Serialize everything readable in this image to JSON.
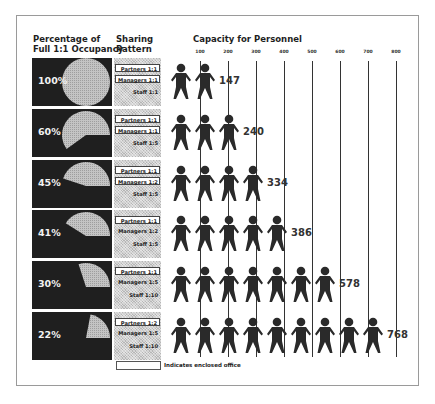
{
  "headers": {
    "occupancy_line1": "Percentage of",
    "occupancy_line2": "Full 1:1 Occupancy",
    "sharing_line1": "Sharing",
    "sharing_line2": "Pattern",
    "capacity": "Capacity for Personnel"
  },
  "axis_ticks": [
    "100",
    "200",
    "300",
    "400",
    "500",
    "600",
    "700",
    "800"
  ],
  "rows": [
    {
      "pct_label": "100%",
      "pct": 100,
      "partners": "Partners 1:1",
      "partners_enclosed": true,
      "managers": "Managers 1:1",
      "managers_enclosed": true,
      "staff": "Staff 1:1",
      "staff_enclosed": false,
      "people": 2,
      "capacity": "147"
    },
    {
      "pct_label": "60%",
      "pct": 60,
      "partners": "Partners 1:1",
      "partners_enclosed": true,
      "managers": "Managers 1:1",
      "managers_enclosed": true,
      "staff": "Staff 1:5",
      "staff_enclosed": false,
      "people": 3,
      "capacity": "240"
    },
    {
      "pct_label": "45%",
      "pct": 45,
      "partners": "Partners 1:1",
      "partners_enclosed": true,
      "managers": "Managers 1:2",
      "managers_enclosed": true,
      "staff": "Staff 1:5",
      "staff_enclosed": false,
      "people": 4,
      "capacity": "334"
    },
    {
      "pct_label": "41%",
      "pct": 41,
      "partners": "Partners 1:1",
      "partners_enclosed": true,
      "managers": "Managers 1:2",
      "managers_enclosed": false,
      "staff": "Staff 1:5",
      "staff_enclosed": false,
      "people": 5,
      "capacity": "386"
    },
    {
      "pct_label": "30%",
      "pct": 30,
      "partners": "Partners 1:1",
      "partners_enclosed": true,
      "managers": "Managers 1:5",
      "managers_enclosed": false,
      "staff": "Staff 1:10",
      "staff_enclosed": false,
      "people": 7,
      "capacity": "578"
    },
    {
      "pct_label": "22%",
      "pct": 22,
      "partners": "Partners 1:2",
      "partners_enclosed": true,
      "managers": "Managers 1:5",
      "managers_enclosed": false,
      "staff": "Staff 1:10",
      "staff_enclosed": false,
      "people": 9,
      "capacity": "768"
    }
  ],
  "legend": {
    "text": "Indicates enclosed office"
  },
  "colors": {
    "dark_panel": "#1f1f1f",
    "pie_fill": "#bdbdbd",
    "person": "#2a2a2a"
  }
}
